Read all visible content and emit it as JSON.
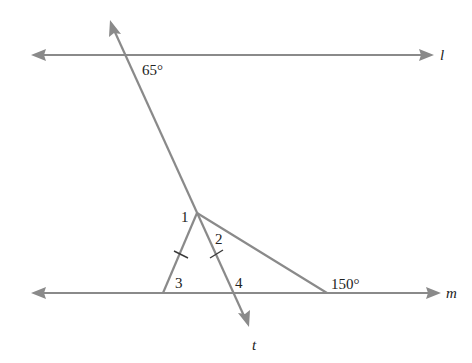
{
  "diagram": {
    "type": "geometry",
    "lines": {
      "l": {
        "label": "l"
      },
      "m": {
        "label": "m"
      },
      "t": {
        "label": "t"
      }
    },
    "angle_labels": {
      "angle_65": "65°",
      "angle_150": "150°",
      "angle_1": "1",
      "angle_2": "2",
      "angle_3": "3",
      "angle_4": "4"
    },
    "colors": {
      "line": "#8a8a8a",
      "text": "#222222",
      "tick": "#3a3a3a"
    }
  }
}
